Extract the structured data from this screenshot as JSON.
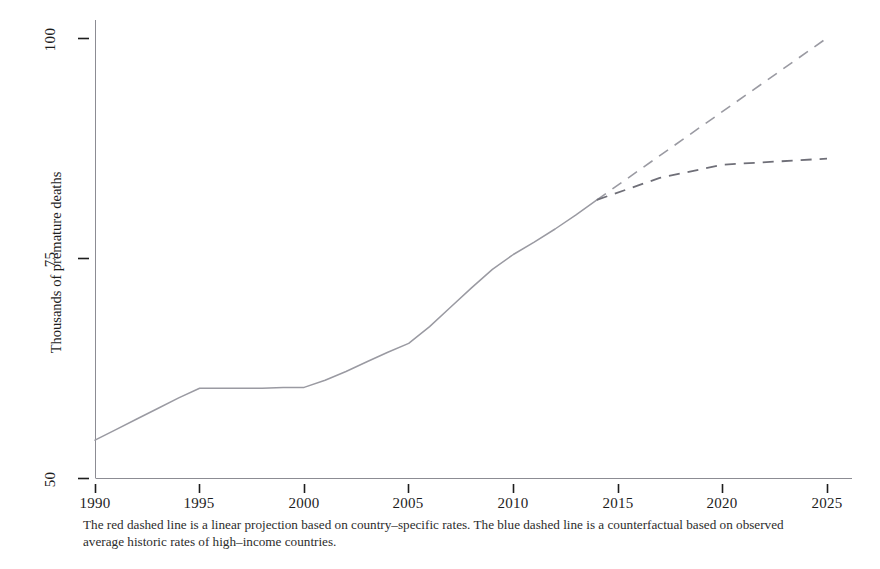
{
  "figure": {
    "caption": "The red dashed line is a linear projection based on country–specific rates. The blue dashed line is a counterfactual based on observed average historic rates of high–income countries.",
    "axis_color": "#8c8c93",
    "line_color": "#9a9aa2",
    "text_color": "#1d1d1d"
  },
  "chart_data": {
    "type": "line",
    "title": "",
    "xlabel": "",
    "ylabel": "Thousands of premature deaths",
    "xlim": [
      1990,
      2025
    ],
    "ylim": [
      50,
      100
    ],
    "grid": false,
    "legend_position": "none",
    "xticks": [
      1990,
      1995,
      2000,
      2005,
      2010,
      2015,
      2020,
      2025
    ],
    "xtick_labels": [
      "1990",
      "1995",
      "2000",
      "2005",
      "2010",
      "2015",
      "2020",
      "2025"
    ],
    "yticks": [
      50,
      75,
      100
    ],
    "ytick_labels": [
      "50",
      "75",
      "100"
    ],
    "series": [
      {
        "name": "observed",
        "style": "solid",
        "color": "#9a9aa2",
        "x": [
          1990,
          1991,
          1992,
          1993,
          1994,
          1995,
          1996,
          1997,
          1998,
          1999,
          2000,
          2001,
          2002,
          2003,
          2004,
          2005,
          2006,
          2007,
          2008,
          2009,
          2010,
          2011,
          2012,
          2013,
          2014
        ],
        "values": [
          54.3,
          55.5,
          56.7,
          57.9,
          59.1,
          60.2,
          60.2,
          60.2,
          60.2,
          60.3,
          60.3,
          61.1,
          62.1,
          63.2,
          64.3,
          65.3,
          67.2,
          69.4,
          71.6,
          73.7,
          75.4,
          76.8,
          78.3,
          79.9,
          81.6
        ]
      },
      {
        "name": "linear projection (red dashed)",
        "style": "dashed",
        "color": "#9a9aa2",
        "x": [
          2014,
          2025
        ],
        "values": [
          81.6,
          100.0
        ]
      },
      {
        "name": "counterfactual (blue dashed)",
        "style": "dashed",
        "color": "#9a9aa2",
        "x": [
          2014,
          2017,
          2020,
          2025
        ],
        "values": [
          81.6,
          84.1,
          85.6,
          86.3
        ]
      }
    ],
    "annotations": [
      "The red dashed line is a linear projection based on country–specific rates.",
      "The blue dashed line is a counterfactual based on observed average historic rates of high–income countries."
    ]
  },
  "ticks": {
    "x": [
      {
        "label": "1990",
        "px": 95
      },
      {
        "label": "1995",
        "px": 199
      },
      {
        "label": "2000",
        "px": 304
      },
      {
        "label": "2005",
        "px": 408
      },
      {
        "label": "2010",
        "px": 513
      },
      {
        "label": "2015",
        "px": 618
      },
      {
        "label": "2020",
        "px": 722
      },
      {
        "label": "2025",
        "px": 827
      }
    ],
    "y": [
      {
        "label": "100",
        "px": 38
      },
      {
        "label": "75",
        "px": 258
      },
      {
        "label": "50",
        "px": 478
      }
    ]
  }
}
